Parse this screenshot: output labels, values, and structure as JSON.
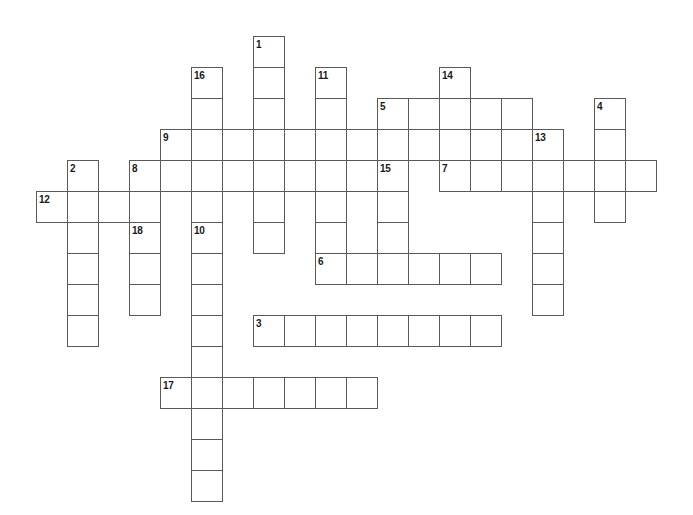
{
  "puzzle": {
    "title": "Crossword Puzzle Grid",
    "type": "crossword-grid",
    "canvas": {
      "width": 693,
      "height": 515,
      "background": "#ffffff"
    },
    "geometry": {
      "cell_size": 31,
      "origin_x": 5,
      "origin_y": 5,
      "line_color": "#5a5a5a",
      "line_width": 1,
      "number_color": "#1a1a1a",
      "number_font_size": 10
    },
    "entries": [
      {
        "number": "1",
        "direction": "down",
        "col": 8,
        "row": 1,
        "length": 7
      },
      {
        "number": "2",
        "direction": "down",
        "col": 2,
        "row": 5,
        "length": 6
      },
      {
        "number": "3",
        "direction": "across",
        "col": 8,
        "row": 10,
        "length": 8
      },
      {
        "number": "4",
        "direction": "down",
        "col": 19,
        "row": 3,
        "length": 4
      },
      {
        "number": "5",
        "direction": "across",
        "col": 12,
        "row": 3,
        "length": 5
      },
      {
        "number": "6",
        "direction": "across",
        "col": 10,
        "row": 8,
        "length": 6
      },
      {
        "number": "7",
        "direction": "across",
        "col": 14,
        "row": 5,
        "length": 7
      },
      {
        "number": "8",
        "direction": "across",
        "col": 4,
        "row": 5,
        "length": 9
      },
      {
        "number": "9",
        "direction": "across",
        "col": 5,
        "row": 4,
        "length": 13
      },
      {
        "number": "10",
        "direction": "down",
        "col": 6,
        "row": 7,
        "length": 9
      },
      {
        "number": "11",
        "direction": "down",
        "col": 10,
        "row": 2,
        "length": 6
      },
      {
        "number": "12",
        "direction": "across",
        "col": 1,
        "row": 6,
        "length": 4
      },
      {
        "number": "13",
        "direction": "down",
        "col": 17,
        "row": 4,
        "length": 6
      },
      {
        "number": "14",
        "direction": "down",
        "col": 14,
        "row": 2,
        "length": 4
      },
      {
        "number": "15",
        "direction": "down",
        "col": 12,
        "row": 5,
        "length": 3
      },
      {
        "number": "16",
        "direction": "down",
        "col": 6,
        "row": 2,
        "length": 5
      },
      {
        "number": "17",
        "direction": "across",
        "col": 5,
        "row": 12,
        "length": 7
      },
      {
        "number": "18",
        "direction": "down",
        "col": 4,
        "row": 7,
        "length": 3
      }
    ],
    "numbered_cells": [
      {
        "label": "1",
        "col": 8,
        "row": 1
      },
      {
        "label": "16",
        "col": 6,
        "row": 2
      },
      {
        "label": "11",
        "col": 10,
        "row": 2
      },
      {
        "label": "14",
        "col": 14,
        "row": 2
      },
      {
        "label": "5",
        "col": 12,
        "row": 3
      },
      {
        "label": "4",
        "col": 19,
        "row": 3
      },
      {
        "label": "9",
        "col": 5,
        "row": 4
      },
      {
        "label": "13",
        "col": 17,
        "row": 4
      },
      {
        "label": "2",
        "col": 2,
        "row": 5
      },
      {
        "label": "8",
        "col": 4,
        "row": 5
      },
      {
        "label": "15",
        "col": 12,
        "row": 5
      },
      {
        "label": "7",
        "col": 14,
        "row": 5
      },
      {
        "label": "12",
        "col": 1,
        "row": 6
      },
      {
        "label": "18",
        "col": 4,
        "row": 7
      },
      {
        "label": "10",
        "col": 6,
        "row": 7
      },
      {
        "label": "6",
        "col": 10,
        "row": 8
      },
      {
        "label": "3",
        "col": 8,
        "row": 10
      },
      {
        "label": "17",
        "col": 5,
        "row": 12
      }
    ],
    "letters": []
  }
}
